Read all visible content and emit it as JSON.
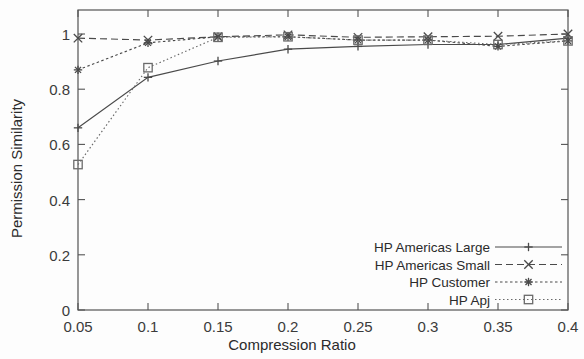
{
  "chart_data": {
    "type": "line",
    "title": "",
    "xlabel": "Compression Ratio",
    "ylabel": "Permission Similarity",
    "x": [
      0.05,
      0.1,
      0.15,
      0.2,
      0.25,
      0.3,
      0.35,
      0.4
    ],
    "xlim": [
      0.05,
      0.4
    ],
    "ylim": [
      0,
      1.09
    ],
    "xticks": [
      "0.05",
      "0.1",
      "0.15",
      "0.2",
      "0.25",
      "0.3",
      "0.35",
      "0.4"
    ],
    "xtick_values": [
      0.05,
      0.1,
      0.15,
      0.2,
      0.25,
      0.3,
      0.35,
      0.4
    ],
    "yticks": [
      "0",
      "0.2",
      "0.4",
      "0.6",
      "0.8",
      "1"
    ],
    "ytick_values": [
      0,
      0.2,
      0.4,
      0.6,
      0.8,
      1
    ],
    "grid": false,
    "legend_position": "bottom-right",
    "series": [
      {
        "name": "HP Americas Large",
        "marker": "plus",
        "dash": "solid",
        "color": "#4a4a4a",
        "values": [
          0.66,
          0.843,
          0.902,
          0.945,
          0.955,
          0.962,
          0.962,
          0.985
        ]
      },
      {
        "name": "HP Americas Small",
        "marker": "cross",
        "dash": "dashed",
        "color": "#4a4a4a",
        "values": [
          0.985,
          0.978,
          0.99,
          0.997,
          0.988,
          0.99,
          0.992,
          1.0
        ]
      },
      {
        "name": "HP Customer",
        "marker": "asterisk",
        "dash": "dotted",
        "color": "#4a4a4a",
        "values": [
          0.87,
          0.968,
          0.99,
          0.99,
          0.978,
          0.978,
          0.955,
          0.975
        ]
      },
      {
        "name": "HP Apj",
        "marker": "square",
        "dash": "fine-dotted",
        "color": "#6a6a6a",
        "values": [
          0.527,
          0.878,
          0.988,
          0.99,
          0.978,
          0.978,
          0.962,
          0.975
        ]
      }
    ]
  },
  "legend": {
    "entries": [
      {
        "label": "HP Americas Large"
      },
      {
        "label": "HP Americas Small"
      },
      {
        "label": "HP Customer"
      },
      {
        "label": "HP Apj"
      }
    ]
  }
}
